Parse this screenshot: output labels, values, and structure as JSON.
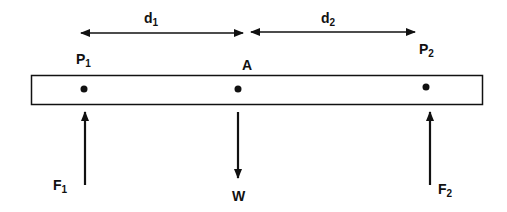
{
  "diagram": {
    "type": "beam free-body diagram",
    "colors": {
      "stroke": "#111111",
      "background": "#ffffff"
    },
    "dimensions": [
      {
        "id": "d1",
        "label": "d",
        "sub": "1"
      },
      {
        "id": "d2",
        "label": "d",
        "sub": "2"
      }
    ],
    "points": [
      {
        "id": "P1",
        "label": "P",
        "sub": "1"
      },
      {
        "id": "A",
        "label": "A",
        "sub": ""
      },
      {
        "id": "P2",
        "label": "P",
        "sub": "2"
      }
    ],
    "forces": [
      {
        "id": "F1",
        "label": "F",
        "sub": "1",
        "direction": "up"
      },
      {
        "id": "W",
        "label": "W",
        "sub": "",
        "direction": "down"
      },
      {
        "id": "F2",
        "label": "F",
        "sub": "2",
        "direction": "up"
      }
    ]
  }
}
